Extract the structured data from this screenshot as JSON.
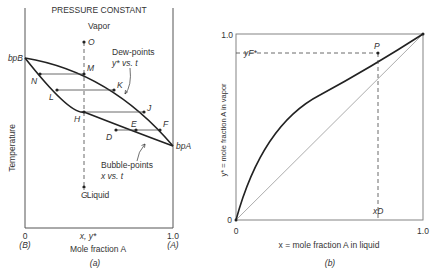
{
  "panel_a": {
    "title": "PRESSURE CONSTANT",
    "region_vapor": "Vapor",
    "region_liquid": "Liquid",
    "ylabel": "Temperature",
    "xlabel": "Mole fraction A",
    "x_tick_left": "0",
    "x_tick_left_sub": "(B)",
    "x_tick_right": "1.0",
    "x_tick_right_sub": "(A)",
    "x_tick_mid": "x, y*",
    "bp_b": "bpB",
    "bp_a": "bpA",
    "dew_label_1": "Dew-points",
    "dew_label_2": "y* vs. t",
    "bubble_label_1": "Bubble-points",
    "bubble_label_2": "x vs. t",
    "caption": "(a)",
    "points": {
      "O": "O",
      "M": "M",
      "N": "N",
      "K": "K",
      "L": "L",
      "J": "J",
      "H": "H",
      "E": "E",
      "F": "F",
      "D": "D",
      "G": "G"
    }
  },
  "panel_b": {
    "ylabel": "y* = mole fraction A in vapor",
    "xlabel": "x = mole fraction A in liquid",
    "y_tick_top": "1.0",
    "y_tick_bottom": "0",
    "x_tick_left": "0",
    "x_tick_right": "1.0",
    "yf_label": "yF*",
    "xd_label": "xD",
    "point_p": "P",
    "caption": "(b)"
  }
}
